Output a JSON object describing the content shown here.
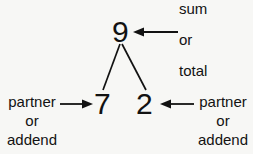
{
  "diagram": {
    "background_color": "#f7f7f5",
    "ink_color": "#121212",
    "total": {
      "value": "9",
      "label_lines": [
        "sum",
        "or",
        "total"
      ]
    },
    "parts": [
      {
        "value": "7",
        "label_lines": [
          "partner",
          "or",
          "addend"
        ]
      },
      {
        "value": "2",
        "label_lines": [
          "partner",
          "or",
          "addend"
        ]
      }
    ],
    "arrows": [
      {
        "name": "arrow-to-total",
        "direction": "left"
      },
      {
        "name": "arrow-to-left-part",
        "direction": "right"
      },
      {
        "name": "arrow-to-right-part",
        "direction": "left"
      }
    ]
  }
}
